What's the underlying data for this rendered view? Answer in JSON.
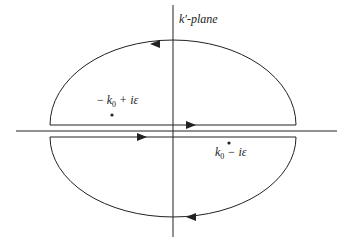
{
  "diagram": {
    "plane_label": "k′-plane",
    "pole_upper": {
      "prefix": "− ",
      "k": "k",
      "sub": "0",
      "rest": " + iε"
    },
    "pole_lower": {
      "k": "k",
      "sub": "0",
      "rest": " − iε"
    },
    "colors": {
      "stroke": "#222222",
      "background": "#ffffff"
    }
  }
}
